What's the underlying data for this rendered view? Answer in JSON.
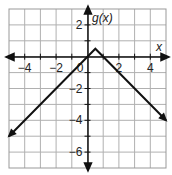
{
  "chart_data": {
    "type": "line",
    "title": "",
    "function_label": "g(x)",
    "xlabel": "x",
    "ylabel": "g(x)",
    "xlim": [
      -5,
      5
    ],
    "ylim": [
      -7,
      3
    ],
    "grid": true,
    "x_ticks": [
      -4,
      -2,
      2,
      4
    ],
    "y_ticks": [
      2,
      -2,
      -4,
      -6
    ],
    "x_tick_labels": [
      "−4",
      "−2",
      "2",
      "4"
    ],
    "y_tick_labels": [
      "2",
      "−2",
      "−4",
      "−6"
    ],
    "origin_label": "0",
    "series": [
      {
        "name": "g(x) = -|x - 0.5| + 0.5",
        "x": [
          -5,
          0.5,
          5
        ],
        "y": [
          -5,
          0.5,
          -4
        ],
        "arrows": "both ends"
      }
    ]
  }
}
